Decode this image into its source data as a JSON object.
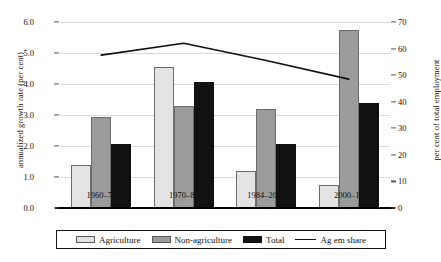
{
  "chart_data": {
    "type": "bar",
    "title": "",
    "subtitle": "",
    "xlabel": "",
    "ylabel": "annualized growth rate (per cent)",
    "y2label": "per cent of total employment",
    "categories": [
      "1960–70",
      "1970–84",
      "1984–2000",
      "2000–10"
    ],
    "ylim": [
      0.0,
      6.0
    ],
    "y2lim": [
      0,
      70
    ],
    "grid": true,
    "legend_position": "bottom",
    "yticks": [
      "0.0",
      "1.0",
      "2.0",
      "3.0",
      "4.0",
      "5.0",
      "6.0"
    ],
    "ytick_values": [
      0.0,
      1.0,
      2.0,
      3.0,
      4.0,
      5.0,
      6.0
    ],
    "y2ticks": [
      "0",
      "10",
      "20",
      "30",
      "40",
      "50",
      "60",
      "70"
    ],
    "y2tick_values": [
      0,
      10,
      20,
      30,
      40,
      50,
      60,
      70
    ],
    "series": [
      {
        "name": "Agriculture",
        "kind": "bar",
        "axis": "left",
        "color": "#e3e3e3",
        "values": [
          1.4,
          4.55,
          1.2,
          0.75
        ]
      },
      {
        "name": "Non-agriculture",
        "kind": "bar",
        "axis": "left",
        "color": "#9b9b9b",
        "values": [
          2.95,
          3.3,
          3.2,
          5.75
        ]
      },
      {
        "name": "Total",
        "kind": "bar",
        "axis": "left",
        "color": "#111111",
        "values": [
          2.05,
          4.05,
          2.05,
          3.4
        ]
      },
      {
        "name": "Ag em share",
        "kind": "line",
        "axis": "right",
        "color": "#111111",
        "values": [
          57.5,
          62.0,
          55.5,
          48.5
        ]
      }
    ]
  },
  "axes": {
    "left_title": "annualized growth rate (per cent)",
    "right_title": "per cent of total employment"
  },
  "legend": {
    "items": [
      {
        "label": "Agriculture",
        "marker": "swatch-light-gray"
      },
      {
        "label": "Non-agriculture",
        "marker": "swatch-mid-gray"
      },
      {
        "label": "Total",
        "marker": "swatch-black"
      },
      {
        "label": "Ag em share",
        "marker": "line-black"
      }
    ]
  }
}
